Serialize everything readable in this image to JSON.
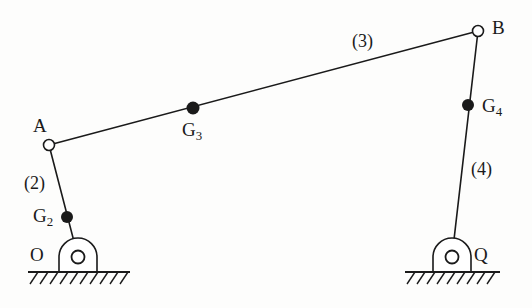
{
  "diagram": {
    "type": "four-bar-linkage-kinematic-diagram",
    "background_color": "#fdfdfc",
    "stroke_color": "#1a1a1a",
    "joints": [
      {
        "id": "O",
        "label": "O",
        "kind": "ground-pivot",
        "x": 78,
        "y": 257,
        "label_x": 30,
        "label_y": 245
      },
      {
        "id": "A",
        "label": "A",
        "kind": "pin-joint",
        "x": 49,
        "y": 145,
        "label_x": 33,
        "label_y": 116
      },
      {
        "id": "B",
        "label": "B",
        "kind": "pin-joint",
        "x": 478,
        "y": 31,
        "label_x": 492,
        "label_y": 18
      },
      {
        "id": "Q",
        "label": "Q",
        "kind": "ground-pivot",
        "x": 452,
        "y": 257,
        "label_x": 474,
        "label_y": 245
      }
    ],
    "mass_centers": [
      {
        "id": "G2",
        "label": "G",
        "subscript": "2",
        "x": 67,
        "y": 217,
        "label_x": 33,
        "label_y": 206
      },
      {
        "id": "G3",
        "label": "G",
        "subscript": "3",
        "x": 193,
        "y": 108,
        "label_x": 182,
        "label_y": 120
      },
      {
        "id": "G4",
        "label": "G",
        "subscript": "4",
        "x": 468,
        "y": 105,
        "label_x": 482,
        "label_y": 96
      }
    ],
    "links": [
      {
        "id": "link2",
        "label": "(2)",
        "from": "O",
        "to": "A",
        "label_x": 24,
        "label_y": 174
      },
      {
        "id": "link3",
        "label": "(3)",
        "from": "A",
        "to": "B",
        "label_x": 352,
        "label_y": 32
      },
      {
        "id": "link4",
        "label": "(4)",
        "from": "Q",
        "to": "B",
        "label_x": 471,
        "label_y": 160
      }
    ],
    "grounds": [
      {
        "id": "ground-left",
        "pivot_x": 78,
        "pivot_y": 257,
        "line_x1": 28,
        "line_x2": 130,
        "line_y": 272
      },
      {
        "id": "ground-right",
        "pivot_x": 452,
        "pivot_y": 257,
        "line_x1": 405,
        "line_x2": 500,
        "line_y": 272
      }
    ]
  }
}
